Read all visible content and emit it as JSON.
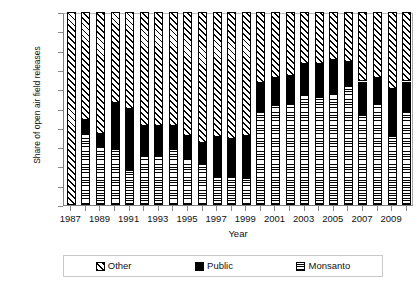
{
  "chart_data": {
    "type": "bar",
    "subtype": "stacked-percent",
    "title": "",
    "xlabel": "Year",
    "ylabel": "Share of open air field releases",
    "ylim": [
      0,
      100
    ],
    "yticks": [
      "0%",
      "10",
      "20",
      "30",
      "40",
      "50",
      "60",
      "70",
      "80",
      "90",
      "100%"
    ],
    "ytick_values": [
      0,
      10,
      20,
      30,
      40,
      50,
      60,
      70,
      80,
      90,
      100
    ],
    "grid": false,
    "legend_position": "bottom",
    "stack_order_bottom_to_top": [
      "Monsanto",
      "Public",
      "Other"
    ],
    "categories": [
      "1987",
      "1988",
      "1989",
      "1990",
      "1991",
      "1992",
      "1993",
      "1994",
      "1995",
      "1996",
      "1997",
      "1998",
      "1999",
      "2000",
      "2001",
      "2002",
      "2003",
      "2004",
      "2005",
      "2006",
      "2007",
      "2008",
      "2009",
      "2010"
    ],
    "xtick_labels": [
      "1987",
      "1989",
      "1991",
      "1993",
      "1995",
      "1997",
      "1999",
      "2001",
      "2003",
      "2005",
      "2007",
      "2009"
    ],
    "series": [
      {
        "name": "Monsanto",
        "fill": "horizontal-lines",
        "values": [
          0,
          37,
          30,
          29,
          18,
          26,
          26,
          29,
          24,
          21,
          15,
          15,
          14,
          48,
          52,
          53,
          57,
          56,
          58,
          62,
          47,
          53,
          36,
          48
        ]
      },
      {
        "name": "Public",
        "fill": "solid-black",
        "values": [
          0,
          7,
          7,
          24,
          32,
          15,
          15,
          12,
          12,
          11,
          20,
          19,
          22,
          15,
          14,
          14,
          16,
          17,
          17,
          12,
          17,
          13,
          24,
          16
        ]
      },
      {
        "name": "Other",
        "fill": "diagonal-hatch",
        "values": [
          100,
          56,
          63,
          47,
          50,
          59,
          59,
          59,
          64,
          68,
          65,
          66,
          64,
          37,
          34,
          33,
          27,
          27,
          25,
          26,
          36,
          34,
          40,
          36
        ]
      }
    ]
  },
  "legend": {
    "items": [
      {
        "label": "Other",
        "fill": "diagonal-hatch"
      },
      {
        "label": "Public",
        "fill": "solid-black"
      },
      {
        "label": "Monsanto",
        "fill": "horizontal-lines"
      }
    ]
  },
  "axes": {
    "y_title": "Share of open air field releases",
    "x_title": "Year"
  }
}
